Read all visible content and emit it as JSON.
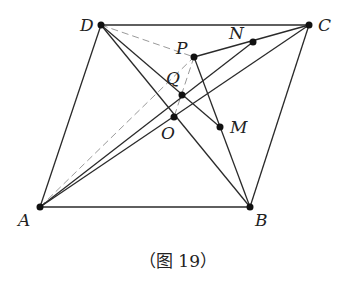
{
  "caption": "（图 19）",
  "colors": {
    "solid": "#2a2a2a",
    "dashed": "#9a9a9a",
    "point": "#111111"
  },
  "points": [
    {
      "name": "D",
      "x": 101,
      "y": 25,
      "lx": 80,
      "ly": 31
    },
    {
      "name": "C",
      "x": 309,
      "y": 25,
      "lx": 318,
      "ly": 31
    },
    {
      "name": "A",
      "x": 40,
      "y": 207,
      "lx": 18,
      "ly": 226
    },
    {
      "name": "B",
      "x": 250,
      "y": 207,
      "lx": 255,
      "ly": 226
    },
    {
      "name": "P",
      "x": 194,
      "y": 57,
      "lx": 176,
      "ly": 54
    },
    {
      "name": "N",
      "x": 253,
      "y": 42,
      "lx": 229,
      "ly": 39
    },
    {
      "name": "Q",
      "x": 182,
      "y": 95,
      "lx": 166,
      "ly": 84
    },
    {
      "name": "O",
      "x": 174,
      "y": 117,
      "lx": 161,
      "ly": 139
    },
    {
      "name": "M",
      "x": 220,
      "y": 127,
      "lx": 230,
      "ly": 133
    }
  ],
  "segments_solid": [
    [
      "D",
      "C"
    ],
    [
      "C",
      "B"
    ],
    [
      "B",
      "A"
    ],
    [
      "A",
      "D"
    ],
    [
      "A",
      "C"
    ],
    [
      "D",
      "B"
    ],
    [
      "D",
      "M"
    ],
    [
      "A",
      "N"
    ],
    [
      "P",
      "C"
    ],
    [
      "P",
      "B"
    ]
  ],
  "segments_dashed": [
    [
      "D",
      "P"
    ],
    [
      "A",
      "P"
    ],
    [
      "P",
      "O"
    ]
  ]
}
